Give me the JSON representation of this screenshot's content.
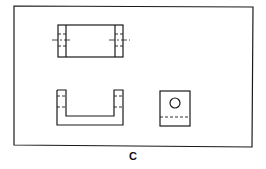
{
  "figure": {
    "caption": "C",
    "views": [
      {
        "name": "top-view",
        "description": "Rectangular block with two hidden holes at ends and centerlines"
      },
      {
        "name": "front-view",
        "description": "U-shaped channel with hidden hole lines in both uprights"
      },
      {
        "name": "side-view",
        "description": "Square with circular hole and hidden line"
      }
    ],
    "line_color": "#1a1a1a",
    "background": "#ffffff"
  }
}
